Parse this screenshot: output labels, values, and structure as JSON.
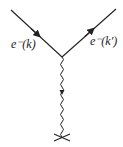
{
  "diagram": {
    "type": "feynman-vertex",
    "incoming": {
      "particle": "e",
      "charge": "-",
      "momentum": "(k)",
      "label": "e⁻(k)"
    },
    "outgoing": {
      "particle": "e",
      "charge": "-",
      "momentum": "(k′)",
      "label": "e⁻(k′)"
    },
    "propagator": {
      "kind": "photon",
      "style": "wavy"
    },
    "external_field": {
      "symbol": "cross"
    },
    "colors": {
      "line": "#222222"
    }
  }
}
